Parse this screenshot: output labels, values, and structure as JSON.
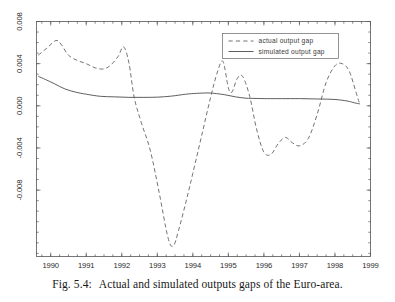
{
  "figure": {
    "caption_number": "Fig. 5.4:",
    "caption_text": "Actual and simulated outputs gaps of the Euro-area."
  },
  "chart_data": {
    "type": "line",
    "title": "",
    "subtitle": "",
    "xlabel": "",
    "ylabel": "",
    "xlim": [
      1989.6,
      1999.0
    ],
    "ylim": [
      -0.0143,
      0.008
    ],
    "grid": false,
    "legend_position": "top-right",
    "xticks": [
      1990,
      1991,
      1992,
      1993,
      1994,
      1995,
      1996,
      1997,
      1998,
      1999
    ],
    "xtick_labels": [
      "1990",
      "1991",
      "1992",
      "1993",
      "1994",
      "1995",
      "1996",
      "1997",
      "1998",
      "1999"
    ],
    "yticks": [
      0.008,
      0.004,
      0.0,
      -0.004,
      -0.008
    ],
    "ytick_labels": [
      "0.008",
      "0.004",
      "0.000",
      "-0.004",
      "-0.008"
    ],
    "x_minor_tick_interval": 0.25,
    "y_minor_tick_interval": 0.001,
    "series": [
      {
        "name": "actual output gap",
        "style": "dashed",
        "color": "#6b6b6b",
        "x": [
          1989.65,
          1989.9,
          1990.15,
          1990.3,
          1990.5,
          1990.75,
          1991.0,
          1991.25,
          1991.5,
          1991.7,
          1991.9,
          1992.05,
          1992.2,
          1992.35,
          1992.55,
          1992.8,
          1993.05,
          1993.3,
          1993.45,
          1993.6,
          1993.8,
          1994.0,
          1994.25,
          1994.5,
          1994.7,
          1994.85,
          1995.0,
          1995.1,
          1995.25,
          1995.4,
          1995.6,
          1995.8,
          1996.0,
          1996.2,
          1996.4,
          1996.6,
          1996.8,
          1997.0,
          1997.25,
          1997.5,
          1997.75,
          1998.0,
          1998.2,
          1998.4,
          1998.6,
          1998.7
        ],
        "y": [
          0.0048,
          0.0055,
          0.0062,
          0.0058,
          0.0048,
          0.0043,
          0.004,
          0.0036,
          0.0035,
          0.0039,
          0.0047,
          0.0056,
          0.0041,
          0.0008,
          -0.0016,
          -0.0042,
          -0.0082,
          -0.0125,
          -0.0133,
          -0.0118,
          -0.0092,
          -0.0064,
          -0.0028,
          0.0008,
          0.0033,
          0.0042,
          0.0017,
          0.0013,
          0.0026,
          0.0028,
          0.0009,
          -0.0023,
          -0.0044,
          -0.0046,
          -0.0036,
          -0.003,
          -0.0035,
          -0.0038,
          -0.0031,
          -0.0008,
          0.0022,
          0.0038,
          0.004,
          0.0033,
          0.0012,
          0.0001
        ]
      },
      {
        "name": "simulated output gap",
        "style": "solid",
        "color": "#555555",
        "x": [
          1989.65,
          1989.85,
          1990.1,
          1990.4,
          1990.7,
          1991.0,
          1991.4,
          1991.8,
          1992.2,
          1992.6,
          1993.0,
          1993.4,
          1993.8,
          1994.1,
          1994.4,
          1994.6,
          1994.9,
          1995.2,
          1995.5,
          1995.75,
          1996.1,
          1996.5,
          1997.0,
          1997.5,
          1998.0,
          1998.35,
          1998.55,
          1998.7
        ],
        "y": [
          0.0028,
          0.0025,
          0.0021,
          0.0016,
          0.0013,
          0.0011,
          0.0009,
          0.00085,
          0.0008,
          0.0008,
          0.00082,
          0.00092,
          0.0011,
          0.00118,
          0.00122,
          0.00118,
          0.00105,
          0.00085,
          0.00072,
          0.0007,
          0.00068,
          0.00068,
          0.00068,
          0.00065,
          0.0006,
          0.00045,
          0.00028,
          0.00018
        ]
      }
    ]
  },
  "legend": {
    "entries": [
      {
        "label": "actual output gap",
        "style": "dashed"
      },
      {
        "label": "simulated output gap",
        "style": "solid"
      }
    ]
  }
}
